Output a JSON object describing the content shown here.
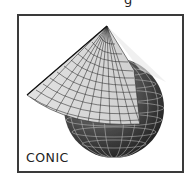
{
  "header": {
    "partial_text": "g"
  },
  "figure": {
    "label": "CONIC",
    "colors": {
      "frame": "#3a3a3a",
      "globe_dark": "#2b2b2b",
      "globe_mid": "#6a6a6a",
      "cone_light": "#d8d8d8",
      "grid_line": "#1e1e1e"
    }
  }
}
